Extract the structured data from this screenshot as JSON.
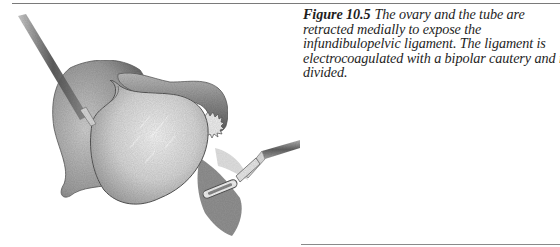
{
  "figure": {
    "label": "Figure 10.5",
    "caption_lines": [
      "The ovary and the tube are",
      "retracted medially to expose the",
      "infundibulopelvic ligament. The ligament is",
      "electrocoagulated with a bipolar cautery and is",
      "divided."
    ],
    "caption_full": "The ovary and the tube are retracted medially to expose the infundibulopelvic ligament. The ligament is electrocoagulated with a bipolar cautery and is divided.",
    "illustration": {
      "subject": "pencil-drawing-laparoscopic-view",
      "elements": [
        "grasping-forceps-upper-left",
        "uterus",
        "ovary",
        "fallopian-tube-with-fimbriae",
        "infundibulopelvic-ligament",
        "bipolar-cautery-forceps-lower-right"
      ]
    }
  },
  "colors": {
    "rule": "#7a7a7a",
    "text": "#1e1e1e",
    "background": "#ffffff"
  }
}
